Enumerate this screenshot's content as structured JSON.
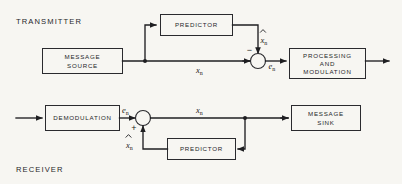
{
  "diagram": {
    "type": "block-diagram",
    "title_transmitter": "TRANSMITTER",
    "title_receiver": "RECEIVER",
    "background_color": "#f7f6f2",
    "line_color": "#1f1f22",
    "text_color": "#26262a"
  },
  "transmitter": {
    "blocks": [
      {
        "id": "message-source",
        "label_line1": "MESSAGE",
        "label_line2": "SOURCE"
      },
      {
        "id": "predictor",
        "label_line1": "PREDICTOR",
        "label_line2": ""
      },
      {
        "id": "processing-and-modulation",
        "label_line1": "PROCESSING",
        "label_line2": "AND",
        "label_line3": "MODULATION"
      }
    ],
    "signals": {
      "x": "x",
      "x_sub": "n",
      "x_hat": "x",
      "x_hat_sub": "n",
      "e": "e",
      "e_sub": "n"
    },
    "summing_junction": {
      "id": "summer-transmitter",
      "minus_sign": "−"
    }
  },
  "receiver": {
    "blocks": [
      {
        "id": "demodulation",
        "label_line1": "DEMODULATION",
        "label_line2": ""
      },
      {
        "id": "predictor",
        "label_line1": "PREDICTOR",
        "label_line2": ""
      },
      {
        "id": "message-sink",
        "label_line1": "MESSAGE",
        "label_line2": "SINK"
      }
    ],
    "signals": {
      "e": "e",
      "e_sub": "n",
      "x": "x",
      "x_sub": "n",
      "x_hat": "x",
      "x_hat_sub": "n"
    },
    "summing_junction": {
      "id": "summer-receiver",
      "plus_sign": "+"
    }
  }
}
